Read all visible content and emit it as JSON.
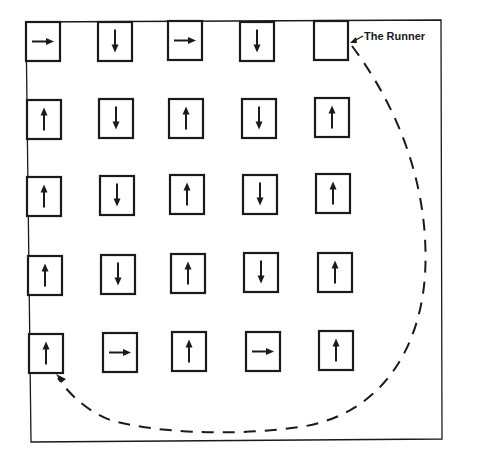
{
  "diagram": {
    "title": "",
    "runner_label": "The Runner",
    "colors": {
      "ink": "#1a1a1a",
      "background": "#ffffff"
    },
    "frame": {
      "x": 26,
      "y": 21,
      "width": 416,
      "height": 419
    },
    "grid": {
      "rows": 5,
      "cols": 5,
      "cells": [
        [
          {
            "x": 26,
            "y": 22,
            "dir": "right"
          },
          {
            "x": 98,
            "y": 22,
            "dir": "down"
          },
          {
            "x": 168,
            "y": 21,
            "dir": "right"
          },
          {
            "x": 240,
            "y": 22,
            "dir": "down"
          },
          {
            "x": 314,
            "y": 21,
            "dir": "empty"
          }
        ],
        [
          {
            "x": 27,
            "y": 100,
            "dir": "up"
          },
          {
            "x": 99,
            "y": 99,
            "dir": "down"
          },
          {
            "x": 169,
            "y": 99,
            "dir": "up"
          },
          {
            "x": 242,
            "y": 99,
            "dir": "down"
          },
          {
            "x": 315,
            "y": 98,
            "dir": "up"
          }
        ],
        [
          {
            "x": 27,
            "y": 177,
            "dir": "up"
          },
          {
            "x": 100,
            "y": 176,
            "dir": "down"
          },
          {
            "x": 170,
            "y": 175,
            "dir": "up"
          },
          {
            "x": 243,
            "y": 175,
            "dir": "down"
          },
          {
            "x": 316,
            "y": 174,
            "dir": "up"
          }
        ],
        [
          {
            "x": 28,
            "y": 256,
            "dir": "up"
          },
          {
            "x": 101,
            "y": 255,
            "dir": "down"
          },
          {
            "x": 171,
            "y": 254,
            "dir": "up"
          },
          {
            "x": 244,
            "y": 253,
            "dir": "down"
          },
          {
            "x": 318,
            "y": 253,
            "dir": "up"
          }
        ],
        [
          {
            "x": 29,
            "y": 334,
            "dir": "up"
          },
          {
            "x": 103,
            "y": 333,
            "dir": "right"
          },
          {
            "x": 172,
            "y": 332,
            "dir": "up"
          },
          {
            "x": 246,
            "y": 332,
            "dir": "right"
          },
          {
            "x": 319,
            "y": 331,
            "dir": "up"
          }
        ]
      ],
      "cell_size": {
        "width": 34,
        "height": 39
      }
    },
    "runner_path": {
      "style": "dashed",
      "from": "empty-cell-row1-col5",
      "to": "cell-row5-col1",
      "description": "Dashed curve from the empty top-right box sweeping around the right side and bottom to the bottom-left box"
    }
  }
}
